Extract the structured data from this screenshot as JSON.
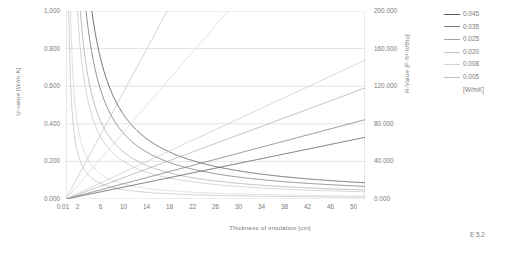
{
  "figure": {
    "caption": "E 5.2"
  },
  "axes": {
    "left": {
      "label": "U-value [W/m·K]",
      "ticks": [
        "0.000",
        "0.200",
        "0.400",
        "0.600",
        "0.800",
        "1.000"
      ],
      "min": 0,
      "max": 1.0,
      "step": 0.2
    },
    "right": {
      "label": "R-Value [F·ft²·h/Btu]",
      "ticks": [
        "0.000",
        "40.000",
        "80.000",
        "120.000",
        "160.000",
        "200.000"
      ],
      "min": 0,
      "max": 200.0,
      "step": 40.0
    },
    "bottom": {
      "label": "Thickness of insulation [cm]",
      "ticks": [
        "0.01",
        "2",
        "6",
        "10",
        "14",
        "18",
        "22",
        "26",
        "30",
        "34",
        "38",
        "42",
        "46",
        "50"
      ],
      "min": 0.01,
      "max": 52,
      "minor_step": 1
    }
  },
  "legend": {
    "unit": "[W/mK]",
    "entries": [
      {
        "label": "0.045",
        "color": "#5a5a5a"
      },
      {
        "label": "0.035",
        "color": "#7d7d7d"
      },
      {
        "label": "0.025",
        "color": "#a3a3a3"
      },
      {
        "label": "0.020",
        "color": "#c2c2c2"
      },
      {
        "label": "0.008",
        "color": "#d2d2d2"
      },
      {
        "label": "0.005",
        "color": "#bdbdbd"
      }
    ]
  },
  "chart_data": {
    "type": "line",
    "title": "",
    "xlabel": "Thickness of insulation [cm]",
    "ylabel": "U-value [W/m·K]",
    "y2label": "R-Value [F·ft²·h/Btu]",
    "xlim": [
      0.01,
      52
    ],
    "ylim": [
      0,
      1.0
    ],
    "y2lim": [
      0,
      200.0
    ],
    "grid": true,
    "legend_position": "top-right",
    "x": [
      0.01,
      1,
      2,
      3,
      4,
      5,
      6,
      8,
      10,
      12,
      14,
      16,
      18,
      20,
      22,
      24,
      26,
      28,
      30,
      34,
      38,
      42,
      46,
      50
    ],
    "series": [
      {
        "name": "0.045 U-value",
        "kind": "u-value",
        "lambda": 0.045,
        "color": "#5a5a5a",
        "axis": "left",
        "values": [
          4.5,
          4.5,
          2.25,
          1.5,
          1.125,
          0.9,
          0.75,
          0.563,
          0.45,
          0.375,
          0.321,
          0.281,
          0.25,
          0.225,
          0.205,
          0.188,
          0.173,
          0.161,
          0.15,
          0.132,
          0.118,
          0.107,
          0.098,
          0.09
        ]
      },
      {
        "name": "0.035 U-value",
        "kind": "u-value",
        "lambda": 0.035,
        "color": "#7d7d7d",
        "axis": "left",
        "values": [
          3.5,
          3.5,
          1.75,
          1.167,
          0.875,
          0.7,
          0.583,
          0.438,
          0.35,
          0.292,
          0.25,
          0.219,
          0.194,
          0.175,
          0.159,
          0.146,
          0.135,
          0.125,
          0.117,
          0.103,
          0.092,
          0.083,
          0.076,
          0.07
        ]
      },
      {
        "name": "0.025 U-value",
        "kind": "u-value",
        "lambda": 0.025,
        "color": "#a3a3a3",
        "axis": "left",
        "values": [
          2.5,
          2.5,
          1.25,
          0.833,
          0.625,
          0.5,
          0.417,
          0.313,
          0.25,
          0.208,
          0.179,
          0.156,
          0.139,
          0.125,
          0.114,
          0.104,
          0.096,
          0.089,
          0.083,
          0.074,
          0.066,
          0.06,
          0.054,
          0.05
        ]
      },
      {
        "name": "0.020 U-value",
        "kind": "u-value",
        "lambda": 0.02,
        "color": "#c2c2c2",
        "axis": "left",
        "values": [
          2.0,
          2.0,
          1.0,
          0.667,
          0.5,
          0.4,
          0.333,
          0.25,
          0.2,
          0.167,
          0.143,
          0.125,
          0.111,
          0.1,
          0.091,
          0.083,
          0.077,
          0.071,
          0.067,
          0.059,
          0.053,
          0.048,
          0.043,
          0.04
        ]
      },
      {
        "name": "0.008 U-value",
        "kind": "u-value",
        "lambda": 0.008,
        "color": "#d2d2d2",
        "axis": "left",
        "values": [
          0.8,
          0.8,
          0.4,
          0.267,
          0.2,
          0.16,
          0.133,
          0.1,
          0.08,
          0.067,
          0.057,
          0.05,
          0.044,
          0.04,
          0.036,
          0.033,
          0.031,
          0.029,
          0.027,
          0.024,
          0.021,
          0.019,
          0.017,
          0.016
        ]
      },
      {
        "name": "0.005 U-value",
        "kind": "u-value",
        "lambda": 0.005,
        "color": "#bdbdbd",
        "axis": "left",
        "values": [
          0.5,
          0.5,
          0.25,
          0.167,
          0.125,
          0.1,
          0.083,
          0.063,
          0.05,
          0.042,
          0.036,
          0.031,
          0.028,
          0.025,
          0.023,
          0.021,
          0.019,
          0.018,
          0.017,
          0.015,
          0.013,
          0.012,
          0.011,
          0.01
        ]
      },
      {
        "name": "0.045 R-value",
        "kind": "r-value",
        "lambda": 0.045,
        "color": "#5a5a5a",
        "axis": "right",
        "values": [
          0.0,
          1.3,
          2.5,
          3.8,
          5.0,
          6.3,
          7.6,
          10.1,
          12.6,
          15.1,
          17.7,
          20.2,
          22.7,
          25.2,
          27.7,
          30.3,
          32.8,
          35.3,
          37.8,
          42.9,
          47.9,
          53.0,
          58.0,
          63.1
        ]
      },
      {
        "name": "0.035 R-value",
        "kind": "r-value",
        "lambda": 0.035,
        "color": "#7d7d7d",
        "axis": "right",
        "values": [
          0.0,
          1.6,
          3.2,
          4.9,
          6.5,
          8.1,
          9.7,
          13.0,
          16.2,
          19.5,
          22.7,
          26.0,
          29.2,
          32.4,
          35.7,
          38.9,
          42.2,
          45.4,
          48.6,
          55.1,
          61.6,
          68.1,
          74.6,
          81.1
        ]
      },
      {
        "name": "0.025 R-value",
        "kind": "r-value",
        "lambda": 0.025,
        "color": "#a3a3a3",
        "axis": "right",
        "values": [
          0.0,
          2.3,
          4.5,
          6.8,
          9.1,
          11.4,
          13.6,
          18.2,
          22.7,
          27.3,
          31.8,
          36.4,
          40.9,
          45.5,
          50.0,
          54.6,
          59.1,
          63.7,
          68.2,
          77.3,
          86.4,
          95.5,
          104.5,
          113.6
        ]
      },
      {
        "name": "0.020 R-value",
        "kind": "r-value",
        "lambda": 0.02,
        "color": "#c2c2c2",
        "axis": "right",
        "values": [
          0.0,
          2.8,
          5.7,
          8.5,
          11.4,
          14.2,
          17.0,
          22.7,
          28.4,
          34.1,
          39.8,
          45.4,
          51.1,
          56.8,
          62.5,
          68.2,
          73.8,
          79.5,
          85.2,
          96.6,
          107.9,
          119.3,
          130.7,
          142.0
        ]
      },
      {
        "name": "0.008 R-value",
        "kind": "r-value",
        "lambda": 0.008,
        "color": "#d2d2d2",
        "axis": "right",
        "values": [
          0.0,
          7.1,
          14.2,
          21.3,
          28.4,
          35.5,
          42.6,
          56.8,
          71.0,
          85.2,
          99.4,
          113.6,
          127.8,
          142.0,
          156.2,
          170.4,
          184.7,
          198.9,
          200.0,
          200.0,
          200.0,
          200.0,
          200.0,
          200.0
        ]
      },
      {
        "name": "0.005 R-value",
        "kind": "r-value",
        "lambda": 0.005,
        "color": "#bdbdbd",
        "axis": "right",
        "values": [
          0.0,
          11.4,
          22.7,
          34.1,
          45.4,
          56.8,
          68.2,
          90.9,
          113.6,
          136.4,
          159.1,
          181.8,
          200.0,
          200.0,
          200.0,
          200.0,
          200.0,
          200.0,
          200.0,
          200.0,
          200.0,
          200.0,
          200.0,
          200.0
        ]
      }
    ]
  }
}
